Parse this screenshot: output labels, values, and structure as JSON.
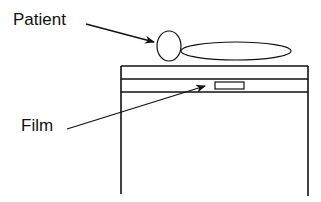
{
  "diagram": {
    "labels": {
      "patient": "Patient",
      "film": "Film"
    },
    "elements": [
      "patient-head",
      "patient-body",
      "table",
      "film-cassette"
    ],
    "colors": {
      "stroke": "#111111",
      "background": "#ffffff"
    }
  }
}
